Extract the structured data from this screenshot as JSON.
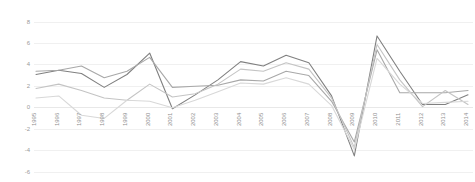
{
  "chart_data": {
    "type": "line",
    "title": "",
    "subtitle": "",
    "xlabel": "",
    "ylabel": "",
    "grid": true,
    "legend_position": "none",
    "categories": [
      "1995",
      "1996",
      "1997",
      "1998",
      "1999",
      "2000",
      "2001",
      "2002",
      "2003",
      "2004",
      "2005",
      "2006",
      "2007",
      "2008",
      "2009",
      "2010",
      "2011",
      "2012",
      "2013",
      "2014"
    ],
    "ylim": [
      -6,
      8
    ],
    "yticks": [
      8,
      6,
      4,
      2,
      0,
      -2,
      -4,
      -6
    ],
    "ytick_labels": [
      "8",
      "6",
      "4",
      "2",
      "0",
      "-2",
      "-4",
      "-6"
    ],
    "xlim_labels": [
      "1995",
      "2014"
    ],
    "series": [
      {
        "name": "series-1",
        "color": "#808080",
        "values": [
          3.1,
          3.5,
          3.2,
          1.9,
          3.1,
          5.1,
          -0.1,
          1.2,
          2.6,
          4.3,
          3.9,
          4.9,
          4.2,
          1.1,
          -4.5,
          6.7,
          3.4,
          0.3,
          0.3,
          1.2
        ]
      },
      {
        "name": "series-2",
        "color": "#a8a8a8",
        "values": [
          3.4,
          3.5,
          3.9,
          2.8,
          3.4,
          4.7,
          1.9,
          2.0,
          2.1,
          2.6,
          2.5,
          3.4,
          3.0,
          0.6,
          -3.2,
          5.4,
          1.4,
          1.4,
          1.4,
          1.6
        ]
      },
      {
        "name": "series-3",
        "color": "#c4c4c4",
        "values": [
          1.8,
          2.2,
          1.6,
          0.9,
          0.7,
          2.2,
          1.0,
          1.3,
          2.2,
          3.6,
          3.4,
          4.2,
          3.6,
          0.9,
          -3.7,
          5.9,
          2.6,
          0.1,
          1.6,
          0.3
        ]
      },
      {
        "name": "series-4",
        "color": "#d8d8d8",
        "values": [
          0.9,
          1.1,
          -0.7,
          -1.0,
          0.7,
          0.6,
          0.0,
          0.7,
          1.5,
          2.3,
          2.2,
          2.8,
          2.2,
          0.2,
          -3.9,
          4.6,
          2.2,
          0.4,
          0.5,
          0.6
        ]
      }
    ]
  },
  "axes": {
    "y_axis_name": "value-axis",
    "x_axis_name": "year-axis"
  }
}
